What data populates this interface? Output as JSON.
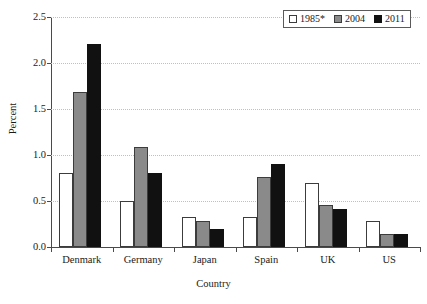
{
  "chart_data": {
    "type": "bar",
    "title": "",
    "xlabel": "Country",
    "ylabel": "Percent",
    "categories": [
      "Denmark",
      "Germany",
      "Japan",
      "Spain",
      "UK",
      "US"
    ],
    "series": [
      {
        "name": "1985*",
        "color": "#ffffff",
        "values": [
          0.8,
          0.5,
          0.33,
          0.33,
          0.7,
          0.28
        ]
      },
      {
        "name": "2004",
        "color": "#8a8a8a",
        "values": [
          1.68,
          1.09,
          0.28,
          0.76,
          0.46,
          0.14
        ]
      },
      {
        "name": "2011",
        "color": "#111111",
        "values": [
          2.21,
          0.8,
          0.2,
          0.9,
          0.41,
          0.14
        ]
      }
    ],
    "ylim": [
      0.0,
      2.5
    ],
    "yticks": [
      0.0,
      0.5,
      1.0,
      1.5,
      2.0,
      2.5
    ],
    "ytick_labels": [
      "0.0",
      "0.5",
      "1.0",
      "1.5",
      "2.0",
      "2.5"
    ],
    "grid": true,
    "grid_axis": "y",
    "grid_style": "dotted",
    "legend_position": "top-right",
    "legend_entries": [
      "1985*",
      "2004",
      "2011"
    ]
  }
}
